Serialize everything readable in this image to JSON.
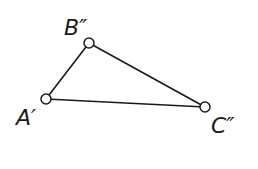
{
  "diagram": {
    "type": "triangle",
    "colors": {
      "stroke": "#1a1a1a",
      "background": "#ffffff",
      "point_fill": "#ffffff"
    },
    "vertices": [
      {
        "id": "A",
        "label": "A′",
        "x": 46,
        "y": 99,
        "label_x": 16,
        "label_y": 125
      },
      {
        "id": "B",
        "label": "B″",
        "x": 89,
        "y": 43,
        "label_x": 64,
        "label_y": 35
      },
      {
        "id": "C",
        "label": "C″",
        "x": 205,
        "y": 107,
        "label_x": 211,
        "label_y": 133
      }
    ],
    "edges": [
      {
        "from": "A",
        "to": "B"
      },
      {
        "from": "B",
        "to": "C"
      },
      {
        "from": "A",
        "to": "C"
      }
    ]
  }
}
